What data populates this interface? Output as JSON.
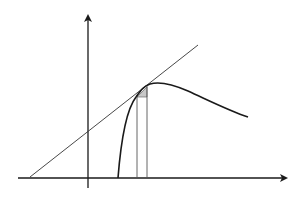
{
  "diagram": {
    "colors": {
      "background": "#ffffff",
      "axis": "#1a1a1a",
      "curve": "#1a1a1a",
      "tangent": "#333333",
      "verticals": "#555555",
      "triangle_fill": "#c8c8c8"
    },
    "elements": {
      "x_axis": "x-axis with arrow",
      "y_axis": "y-axis with arrow",
      "curve": "curve",
      "tangent_line": "tangent line",
      "vertical_left": "vertical line at x",
      "vertical_right": "vertical line at x + dx",
      "increment_triangle": "increment triangle"
    }
  }
}
